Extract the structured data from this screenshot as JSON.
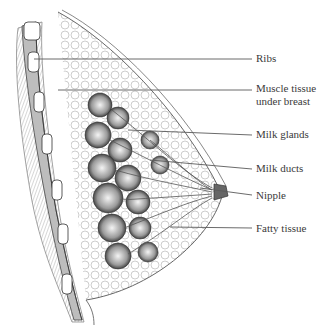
{
  "diagram": {
    "type": "anatomical-cross-section",
    "line_color": "#5a5a5a",
    "labels": [
      {
        "id": "ribs",
        "text": "Ribs",
        "x": 256,
        "y": 54
      },
      {
        "id": "muscle",
        "text": "Muscle tissue under breast",
        "line1": "Muscle tissue",
        "line2": "under breast",
        "x": 256,
        "y": 83
      },
      {
        "id": "glands",
        "text": "Milk glands",
        "x": 256,
        "y": 130
      },
      {
        "id": "ducts",
        "text": "Milk ducts",
        "x": 256,
        "y": 164
      },
      {
        "id": "nipple",
        "text": "Nipple",
        "x": 256,
        "y": 191
      },
      {
        "id": "fatty",
        "text": "Fatty tissue",
        "x": 256,
        "y": 225
      }
    ]
  }
}
